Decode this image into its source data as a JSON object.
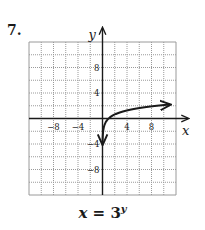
{
  "problem": {
    "number": "7."
  },
  "equation": {
    "lhs": "x",
    "equals": "=",
    "base": "3",
    "exponent": "y"
  },
  "chart_data": {
    "type": "line",
    "xlabel": "x",
    "ylabel": "y",
    "xlim": [
      -12,
      12
    ],
    "ylim": [
      -12,
      12
    ],
    "grid": true,
    "grid_step": 2,
    "x_ticks_labeled": [
      -8,
      -4,
      4,
      8
    ],
    "y_ticks_labeled": [
      8,
      4,
      -4,
      -8
    ],
    "x_tick_labels": [
      "−8",
      "−4",
      "4",
      "8"
    ],
    "y_tick_labels": [
      "8",
      "4",
      "−4",
      "−8"
    ],
    "legend": null,
    "series": [
      {
        "name": "x = 3^y",
        "description": "Inverse of exponential y = 3^x, equivalent to y = log base 3 of x",
        "x": [
          0.012,
          0.037,
          0.111,
          0.333,
          1,
          3,
          9,
          11
        ],
        "y": [
          -4,
          -3,
          -2,
          -1,
          0,
          1,
          2,
          2.18
        ],
        "arrows": "both ends"
      }
    ],
    "colors": {
      "curve": "#1a1a1a",
      "axes": "#1a1a1a",
      "grid": "#9a9a9a",
      "grid_minor": "#c4c4c4"
    }
  }
}
